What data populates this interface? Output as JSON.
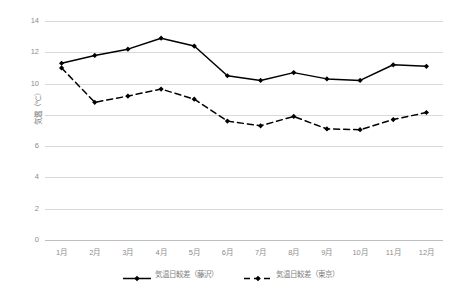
{
  "chart_data": {
    "type": "line",
    "title": "",
    "xlabel": "",
    "ylabel": "気温（℃）",
    "ylim": [
      0,
      14
    ],
    "yticks": [
      0,
      2,
      4,
      6,
      8,
      10,
      12,
      14
    ],
    "ytick_labels": [
      "0",
      "2",
      "4",
      "6",
      "8",
      "10",
      "12",
      "14"
    ],
    "categories": [
      "1月",
      "2月",
      "3月",
      "4月",
      "5月",
      "6月",
      "7月",
      "8月",
      "9月",
      "10月",
      "11月",
      "12月"
    ],
    "grid": "horizontal",
    "legend_position": "bottom-center",
    "series": [
      {
        "name": "気温日較差（藤沢）",
        "style": "solid",
        "marker": "diamond",
        "color": "#000000",
        "values": [
          11.3,
          11.8,
          12.2,
          12.9,
          12.4,
          10.5,
          10.2,
          10.7,
          10.3,
          10.2,
          11.2,
          11.1
        ]
      },
      {
        "name": "気温日較差（東京）",
        "style": "dashed",
        "marker": "diamond",
        "color": "#000000",
        "values": [
          11.0,
          8.8,
          9.2,
          9.65,
          9.0,
          7.6,
          7.3,
          7.9,
          7.1,
          7.05,
          7.7,
          8.15
        ]
      }
    ]
  },
  "colors": {
    "gridline": "#d9d9d9",
    "axis": "#bfbfbf",
    "tick_text": "#8c8c8c",
    "legend_text": "#7f7f7f",
    "series_line": "#000000",
    "background": "#ffffff"
  }
}
